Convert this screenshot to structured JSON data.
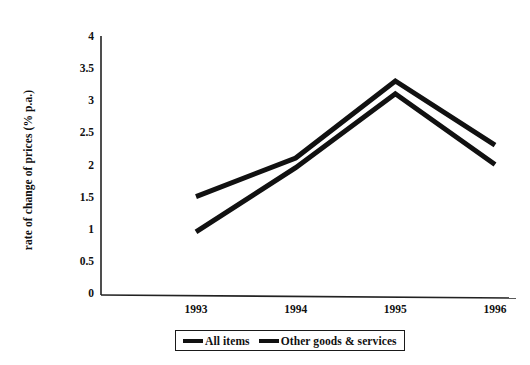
{
  "chart_data": {
    "type": "line",
    "title": "",
    "xlabel": "",
    "ylabel": "rate of change of prices (% p.a.)",
    "categories": [
      "1993",
      "1994",
      "1995",
      "1996"
    ],
    "x_tick_labels": [
      "1993",
      "1994",
      "1995",
      "1996"
    ],
    "y_tick_labels": [
      "0",
      "0.5",
      "1",
      "1.5",
      "2",
      "2.5",
      "3",
      "3.5",
      "4"
    ],
    "y_tick_values": [
      0,
      0.5,
      1,
      1.5,
      2,
      2.5,
      3,
      3.5,
      4
    ],
    "ylim": [
      0,
      4
    ],
    "grid": false,
    "legend_position": "bottom",
    "series": [
      {
        "name": "All items",
        "values": [
          1.5,
          2.1,
          3.3,
          2.3
        ],
        "color": "#111111"
      },
      {
        "name": "Other goods & services",
        "values": [
          0.95,
          1.95,
          3.1,
          2.0
        ],
        "color": "#111111"
      }
    ]
  },
  "legend": {
    "items": [
      {
        "label": "All items"
      },
      {
        "label": "Other goods & services"
      }
    ]
  },
  "axes": {
    "y_title": "rate of change of prices (% p.a.)"
  }
}
